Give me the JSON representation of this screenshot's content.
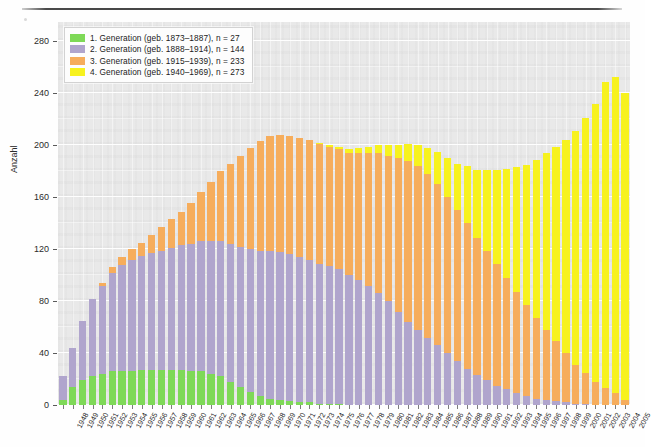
{
  "chart_data": {
    "type": "bar",
    "stacked": true,
    "title": "",
    "xlabel": "",
    "ylabel": "Anzahl",
    "ylim": [
      0,
      295
    ],
    "yticks": [
      0,
      40,
      80,
      120,
      160,
      200,
      240,
      280
    ],
    "grid": true,
    "legend_position": "top-left",
    "categories": [
      "1948",
      "1949",
      "1950",
      "1951",
      "1952",
      "1953",
      "1954",
      "1955",
      "1956",
      "1957",
      "1958",
      "1959",
      "1960",
      "1961",
      "1962",
      "1963",
      "1964",
      "1965",
      "1966",
      "1967",
      "1968",
      "1969",
      "1970",
      "1971",
      "1972",
      "1973",
      "1974",
      "1975",
      "1976",
      "1977",
      "1978",
      "1979",
      "1980",
      "1981",
      "1982",
      "1983",
      "1984",
      "1985",
      "1986",
      "1987",
      "1988",
      "1989",
      "1990",
      "1991",
      "1992",
      "1993",
      "1994",
      "1995",
      "1996",
      "1997",
      "1998",
      "1999",
      "2000",
      "2001",
      "2002",
      "2003",
      "2004",
      "2005"
    ],
    "series": [
      {
        "name": "1. Generation (geb. 1873–1887)",
        "color": "#7ed957",
        "n": 27,
        "values": [
          4,
          14,
          19,
          22,
          24,
          26,
          26,
          26,
          27,
          27,
          27,
          27,
          27,
          26,
          26,
          24,
          22,
          18,
          14,
          10,
          7,
          5,
          4,
          3,
          2,
          2,
          1,
          1,
          1,
          0,
          0,
          0,
          0,
          0,
          0,
          0,
          0,
          0,
          0,
          0,
          0,
          0,
          0,
          0,
          0,
          0,
          0,
          0,
          0,
          0,
          0,
          0,
          0,
          0,
          0,
          0,
          0,
          0
        ]
      },
      {
        "name": "2. Generation (geb. 1888–1914)",
        "color": "#b0a5cd",
        "n": 144,
        "values": [
          18,
          30,
          46,
          60,
          68,
          76,
          82,
          86,
          88,
          90,
          92,
          94,
          96,
          98,
          100,
          102,
          104,
          106,
          108,
          110,
          112,
          114,
          114,
          113,
          112,
          110,
          108,
          106,
          104,
          100,
          96,
          92,
          86,
          80,
          72,
          64,
          58,
          52,
          46,
          40,
          34,
          28,
          23,
          19,
          15,
          12,
          9,
          7,
          5,
          4,
          3,
          2,
          1,
          1,
          0,
          0,
          0,
          0
        ]
      },
      {
        "name": "3. Generation (geb. 1915–1939)",
        "color": "#f6ad5c",
        "n": 233,
        "values": [
          0,
          0,
          0,
          0,
          2,
          4,
          6,
          8,
          10,
          14,
          18,
          22,
          26,
          32,
          38,
          46,
          54,
          62,
          70,
          78,
          84,
          88,
          90,
          91,
          92,
          92,
          92,
          92,
          92,
          94,
          98,
          102,
          108,
          112,
          118,
          124,
          126,
          126,
          124,
          120,
          116,
          112,
          106,
          100,
          94,
          86,
          78,
          70,
          62,
          54,
          46,
          38,
          30,
          24,
          18,
          13,
          9,
          4
        ]
      },
      {
        "name": "4. Generation (geb. 1940–1969)",
        "color": "#f7f21e",
        "n": 273,
        "values": [
          0,
          0,
          0,
          0,
          0,
          0,
          0,
          0,
          0,
          0,
          0,
          0,
          0,
          0,
          0,
          0,
          0,
          0,
          0,
          0,
          0,
          0,
          0,
          0,
          0,
          0,
          1,
          1,
          2,
          3,
          4,
          5,
          6,
          8,
          10,
          13,
          16,
          20,
          25,
          30,
          36,
          44,
          52,
          62,
          72,
          84,
          96,
          108,
          122,
          136,
          150,
          164,
          180,
          196,
          214,
          236,
          244,
          236
        ]
      }
    ]
  },
  "legend": {
    "entries": [
      {
        "label": "1. Generation (geb. 1873–1887), n = 27",
        "color": "#7ed957"
      },
      {
        "label": "2. Generation (geb. 1888–1914), n = 144",
        "color": "#b0a5cd"
      },
      {
        "label": "3. Generation (geb. 1915–1939), n = 233",
        "color": "#f6ad5c"
      },
      {
        "label": "4. Generation (geb. 1940–1969), n = 273",
        "color": "#f7f21e"
      }
    ]
  }
}
